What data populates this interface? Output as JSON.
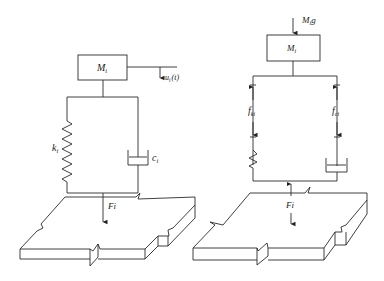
{
  "figure": {
    "left_panel": {
      "mass_label": "M",
      "mass_sub": "i",
      "displacement_label": "u",
      "displacement_sub": "i",
      "displacement_arg": "(t)",
      "spring_label": "k",
      "spring_sub": "i",
      "damper_label": "c",
      "damper_sub": "i",
      "force_label": "Fi"
    },
    "right_panel": {
      "gravity_label": "M",
      "gravity_sub": "i",
      "gravity_g": "g",
      "mass_label": "M",
      "mass_sub": "i",
      "spring_force_label": "f",
      "spring_force_sub": "ki",
      "damper_force_label": "f",
      "damper_force_sub": "ci",
      "force_label": "Fi"
    },
    "colors": {
      "line": "#2a2a2a",
      "background": "#ffffff"
    }
  }
}
